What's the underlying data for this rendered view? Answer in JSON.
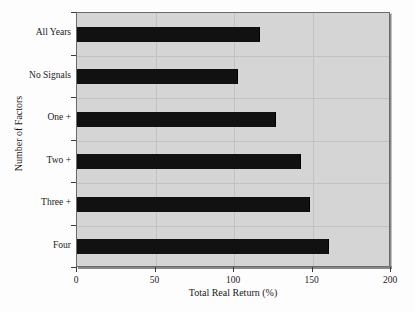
{
  "chart_data": {
    "type": "bar",
    "orientation": "horizontal",
    "title": "",
    "xlabel": "Total Real Return (%)",
    "ylabel": "Number of Factors",
    "categories": [
      "Four",
      "Three +",
      "Two +",
      "One +",
      "No Signals",
      "All Years"
    ],
    "values": [
      160,
      148,
      142,
      126,
      102,
      116
    ],
    "xlim": [
      0,
      200
    ],
    "xticks": [
      0,
      50,
      100,
      150,
      200
    ],
    "xtick_labels": [
      "0",
      "50",
      "100",
      "150",
      "200"
    ],
    "grid": true,
    "legend": "none",
    "series": [
      {
        "name": "Total Real Return (%)",
        "values": [
          160,
          148,
          142,
          126,
          102,
          116
        ]
      }
    ],
    "colors": {
      "bar": "#111111",
      "plot_background": "#d5d5d5",
      "gridline": "#c2c2c2",
      "axis": "#3a3a3a",
      "page_background": "#fdfdfd",
      "text": "#1a1a1a"
    }
  }
}
